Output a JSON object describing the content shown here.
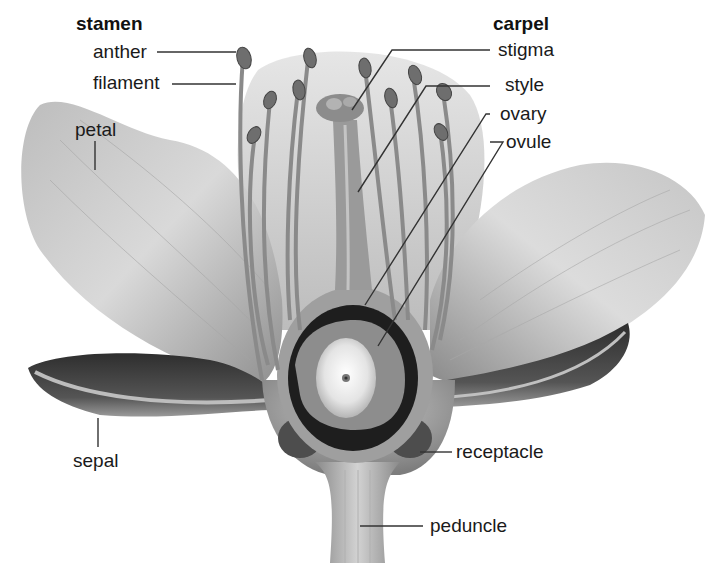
{
  "diagram": {
    "colors": {
      "background": "#ffffff",
      "text": "#1a1a1a",
      "leader_line": "#333333",
      "petal_light": "#d8d8d8",
      "petal_mid": "#b0b0b0",
      "sepal_dark": "#3a3a3a",
      "ovary_cavity": "#1e1e1e",
      "ovule_light": "#f2f2f2"
    },
    "groups": {
      "stamen": {
        "heading": "stamen",
        "parts": [
          {
            "id": "anther",
            "label": "anther"
          },
          {
            "id": "filament",
            "label": "filament"
          }
        ]
      },
      "carpel": {
        "heading": "carpel",
        "parts": [
          {
            "id": "stigma",
            "label": "stigma"
          },
          {
            "id": "style",
            "label": "style"
          },
          {
            "id": "ovary",
            "label": "ovary"
          },
          {
            "id": "ovule",
            "label": "ovule"
          }
        ]
      }
    },
    "other_labels": {
      "petal": "petal",
      "sepal": "sepal",
      "receptacle": "receptacle",
      "peduncle": "peduncle"
    }
  }
}
